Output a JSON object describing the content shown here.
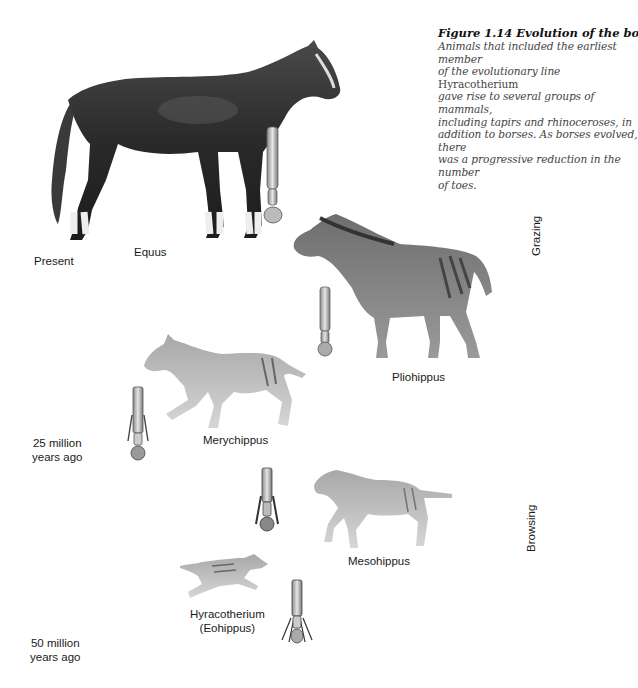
{
  "caption": {
    "title": "Figure 1.14 Evolution of the borse.",
    "body_lines": [
      "Animals that included the earliest member",
      "of the evolutionary line ",
      "Hyracotherium",
      "gave rise to several groups of mammals,",
      "including tapirs and rhinoceroses, in",
      "addition to borses. As borses evolved, there",
      "was a progressive reduction in the number",
      "of toes."
    ]
  },
  "time_labels": {
    "present": "Present",
    "mid_line1": "25 million",
    "mid_line2": "years ago",
    "old_line1": "50 million",
    "old_line2": "years ago"
  },
  "diet_labels": {
    "upper": "Grazing",
    "lower": "Browsing"
  },
  "species": [
    {
      "name": "Equus"
    },
    {
      "name": "Pliohippus"
    },
    {
      "name": "Merychippus"
    },
    {
      "name": "Mesohippus"
    },
    {
      "name": "Hyracotherium",
      "alt_name": "(Eohippus)"
    }
  ]
}
